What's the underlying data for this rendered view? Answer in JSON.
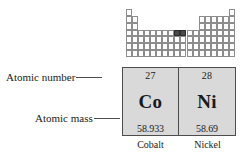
{
  "figure": {
    "periodic_table": {
      "name": "periodic-table-overview",
      "highlighted_note": "Co and Ni cells highlighted",
      "rows": 7,
      "columns": 18,
      "highlight_columns": [
        9,
        10
      ],
      "highlight_row": 4,
      "cell_border_color": "#8d8d8d",
      "highlight_color": "#4a4a4a"
    },
    "callouts": [
      {
        "label": "Atomic number"
      },
      {
        "label": "Atomic mass"
      }
    ],
    "elements": [
      {
        "atomic_number": "27",
        "symbol": "Co",
        "atomic_mass": "58.933",
        "name": "Cobalt"
      },
      {
        "atomic_number": "28",
        "symbol": "Ni",
        "atomic_mass": "58.69",
        "name": "Nickel"
      }
    ],
    "colors": {
      "box_fill": "#d9d9d9",
      "box_border": "#4d4d4d",
      "text": "#1a1a1a",
      "background": "#ffffff"
    }
  }
}
